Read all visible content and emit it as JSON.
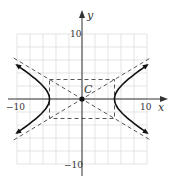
{
  "chart_data": {
    "type": "line",
    "title": "",
    "xlabel": "x",
    "ylabel": "y",
    "xlim": [
      -10,
      10
    ],
    "ylim": [
      -10,
      10
    ],
    "grid": true,
    "grid_step": 2,
    "tick_labels": {
      "x": [
        "-10",
        "10"
      ],
      "y": [
        "10",
        "-10"
      ]
    },
    "equation": "x^2/25 - y^2/9 = 1",
    "center": {
      "label": "C",
      "x": 0,
      "y": 0
    },
    "a": 5,
    "b": 3,
    "vertices": [
      [
        -5,
        0
      ],
      [
        5,
        0
      ]
    ],
    "asymptotes": [
      "y = 0.6x",
      "y = -0.6x"
    ],
    "fundamental_rectangle": {
      "x": [
        -5,
        5
      ],
      "y": [
        -3,
        3
      ]
    },
    "series": [
      {
        "name": "right branch",
        "style": "solid",
        "arrows": true,
        "points": [
          [
            10,
            -5.2
          ],
          [
            8,
            -3.75
          ],
          [
            6,
            -1.99
          ],
          [
            5.5,
            -1.37
          ],
          [
            5,
            0
          ],
          [
            5.5,
            1.37
          ],
          [
            6,
            1.99
          ],
          [
            8,
            3.75
          ],
          [
            10,
            5.2
          ]
        ]
      },
      {
        "name": "left branch",
        "style": "solid",
        "arrows": true,
        "points": [
          [
            -10,
            -5.2
          ],
          [
            -8,
            -3.75
          ],
          [
            -6,
            -1.99
          ],
          [
            -5.5,
            -1.37
          ],
          [
            -5,
            0
          ],
          [
            -5.5,
            1.37
          ],
          [
            -6,
            1.99
          ],
          [
            -8,
            3.75
          ],
          [
            -10,
            5.2
          ]
        ]
      },
      {
        "name": "asymptote y=0.6x",
        "style": "dashed",
        "points": [
          [
            -10.5,
            -6.3
          ],
          [
            10.5,
            6.3
          ]
        ]
      },
      {
        "name": "asymptote y=-0.6x",
        "style": "dashed",
        "points": [
          [
            -10.5,
            6.3
          ],
          [
            10.5,
            -6.3
          ]
        ]
      }
    ]
  },
  "labels": {
    "x_axis": "x",
    "y_axis": "y",
    "x_min": "−10",
    "x_max": "10",
    "y_max": "10",
    "y_min": "−10",
    "center": "C"
  },
  "colors": {
    "grid": "#d9d9d9",
    "axis": "#333333",
    "curve": "#111111",
    "dash": "#444444"
  }
}
